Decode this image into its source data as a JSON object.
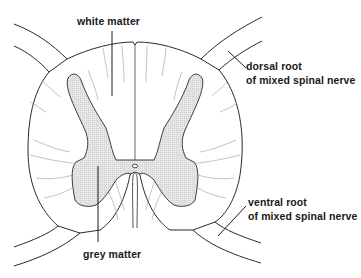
{
  "labels": {
    "white_matter": "white matter",
    "grey_matter": "grey matter",
    "dorsal_root_line1": "dorsal root",
    "dorsal_root_line2": "of mixed spinal nerve",
    "ventral_root_line1": "ventral root",
    "ventral_root_line2": "of mixed spinal nerve"
  },
  "colors": {
    "outline": "#2a2a2a",
    "grey_matter_fill": "#e2e2e2",
    "fibre_lines": "#9a9a9a",
    "background": "#ffffff"
  }
}
